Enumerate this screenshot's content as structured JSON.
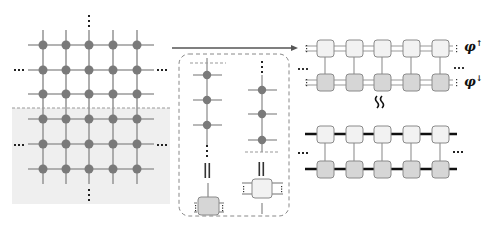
{
  "diagram": {
    "type": "tensor-network-schematic",
    "colors": {
      "grid_line": "#9a9a9a",
      "node": "#7a7a7a",
      "shaded_region": "#efefef",
      "dashed": "#888888",
      "tensor_light": "#f2f2f2",
      "tensor_dark": "#d6d6d6",
      "tensor_border": "#8a8a8a",
      "bond_thick": "#111111",
      "arrow": "#555555"
    },
    "left_panel": {
      "name": "2D PEPS lattice",
      "rows": 6,
      "cols": 5,
      "shaded_rows_from": 3,
      "ellipsis": "..."
    },
    "middle_panel": {
      "name": "column contraction inset",
      "left_column_nodes": 3,
      "right_column_nodes": 3,
      "equals_symbol": "||"
    },
    "right_panel": {
      "top_mps": {
        "tensors": 5,
        "upper_label": "φ",
        "upper_sup": "↑",
        "lower_label": "φ",
        "lower_sup": "↓"
      },
      "approx_symbol": "≀≀",
      "bottom_mps": {
        "tensors": 5
      },
      "ellipsis": "..."
    }
  }
}
